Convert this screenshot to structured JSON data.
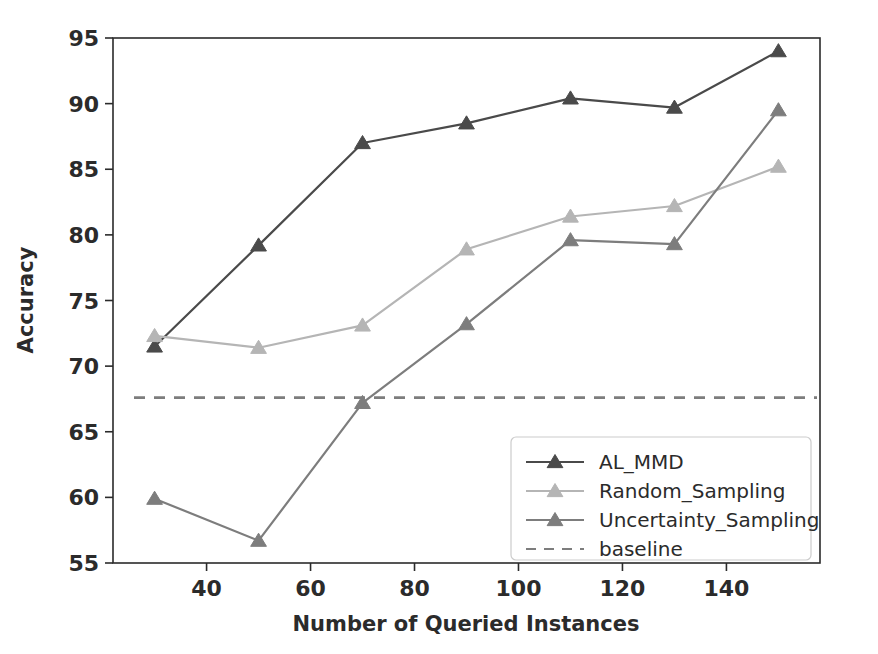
{
  "chart_data": {
    "type": "line",
    "title": "",
    "xlabel": "Number of Queried Instances",
    "ylabel": "Accuracy",
    "x": [
      30,
      50,
      70,
      90,
      110,
      130,
      150
    ],
    "xlim": [
      22,
      158
    ],
    "ylim": [
      55,
      95
    ],
    "xticks": [
      40,
      60,
      80,
      100,
      120,
      140
    ],
    "yticks": [
      55,
      60,
      65,
      70,
      75,
      80,
      85,
      90,
      95
    ],
    "xticklabels": [
      "40",
      "60",
      "80",
      "100",
      "120",
      "140"
    ],
    "yticklabels": [
      "55",
      "60",
      "65",
      "70",
      "75",
      "80",
      "85",
      "90",
      "95"
    ],
    "grid": false,
    "legend_position": "lower right",
    "marker": "triangle-up",
    "series": [
      {
        "name": "AL_MMD",
        "color": "#4a4a4a",
        "values": [
          71.5,
          79.2,
          87.0,
          88.5,
          90.4,
          89.7,
          94.0
        ]
      },
      {
        "name": "Random_Sampling",
        "color": "#b5b5b5",
        "values": [
          72.3,
          71.4,
          73.1,
          78.9,
          81.4,
          82.2,
          85.2
        ]
      },
      {
        "name": "Uncertainty_Sampling",
        "color": "#7d7d7d",
        "values": [
          59.9,
          56.7,
          67.2,
          73.2,
          79.6,
          79.3,
          89.5
        ]
      }
    ],
    "baseline": {
      "name": "baseline",
      "value": 67.6,
      "color": "#7d7d7d",
      "style": "dashed"
    }
  },
  "legend": {
    "items": [
      {
        "label": "AL_MMD",
        "color": "#4a4a4a",
        "style": "solid-marker"
      },
      {
        "label": "Random_Sampling",
        "color": "#b5b5b5",
        "style": "solid-marker"
      },
      {
        "label": "Uncertainty_Sampling",
        "color": "#7d7d7d",
        "style": "solid-marker"
      },
      {
        "label": "baseline",
        "color": "#7d7d7d",
        "style": "dashed"
      }
    ]
  },
  "axes": {
    "x_title": "Number of Queried Instances",
    "y_title": "Accuracy"
  },
  "colors": {
    "axis": "#2b2b2b",
    "background": "#ffffff",
    "series_dark": "#4a4a4a",
    "series_light": "#b5b5b5",
    "series_mid": "#7d7d7d"
  }
}
